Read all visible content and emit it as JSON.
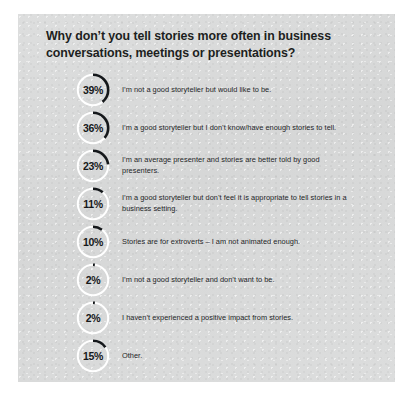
{
  "card": {
    "background_color": "#d8d9d9",
    "page_background": "#ffffff"
  },
  "headline": "Why don’t you tell stories more often in business conversations, meetings or presentations?",
  "chart_data": {
    "type": "bar",
    "title": "Why don’t you tell stories more often in business conversations, meetings or presentations?",
    "xlabel": "",
    "ylabel": "",
    "ylim": [
      0,
      100
    ],
    "unit": "%",
    "categories": [
      "I’m not a good storyteller but would like to be.",
      "I’m a good storyteller but I don’t know/have enough stories to tell.",
      "I’m an average presenter and stories are better told by good presenters.",
      "I’m a good storyteller but don’t feel it is appropriate to tell stories in a business setting.",
      "Stories are for extroverts – I am not animated enough.",
      "I’m not a good storyteller and don’t want to be.",
      "I haven’t experienced a positive impact from stories.",
      "Other."
    ],
    "values": [
      39,
      36,
      23,
      11,
      10,
      2,
      2,
      15
    ],
    "arc_color": "#15181b",
    "track_color": "#ffffff"
  },
  "rows": [
    {
      "value": 39,
      "percent_label": "39%",
      "text": "I’m not a good storyteller but would like to be."
    },
    {
      "value": 36,
      "percent_label": "36%",
      "text": "I’m a good storyteller but I don’t know/have enough stories to tell."
    },
    {
      "value": 23,
      "percent_label": "23%",
      "text": "I’m an average presenter and stories are better told by good presenters."
    },
    {
      "value": 11,
      "percent_label": "11%",
      "text": "I’m a good storyteller but don’t feel it is appropriate to tell stories in a business setting."
    },
    {
      "value": 10,
      "percent_label": "10%",
      "text": "Stories are for extroverts – I am not animated enough."
    },
    {
      "value": 2,
      "percent_label": "2%",
      "text": "I’m not a good storyteller and don’t want to be."
    },
    {
      "value": 2,
      "percent_label": "2%",
      "text": "I haven’t experienced a positive impact from stories."
    },
    {
      "value": 15,
      "percent_label": "15%",
      "text": "Other."
    }
  ]
}
